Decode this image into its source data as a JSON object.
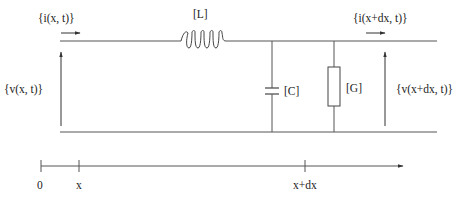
{
  "diagram": {
    "type": "transmission-line-element-circuit",
    "labels": {
      "current_in": "{i(x, t)}",
      "current_out": "{i(x+dx, t)}",
      "voltage_in": "{v(x, t)}",
      "voltage_out": "{v(x+dx, t)}",
      "inductor": "[L]",
      "capacitor": "[C]",
      "conductance": "[G]"
    },
    "axis": {
      "ticks": [
        {
          "label": "0"
        },
        {
          "label": "x"
        },
        {
          "label": "x+dx"
        }
      ]
    },
    "colors": {
      "line": "#555555",
      "text": "#222222"
    }
  }
}
